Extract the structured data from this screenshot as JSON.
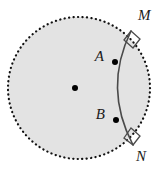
{
  "figure": {
    "type": "geometry-diagram",
    "width": 166,
    "height": 170,
    "background_color": "#ffffff"
  },
  "colors": {
    "disk_fill": "#e3e3e3",
    "disk_border": "#111111",
    "arc_stroke": "#4a4a4a",
    "point_fill": "#000000",
    "label_color": "#1a1a1a",
    "right_angle_stroke": "#4a4a4a"
  },
  "circle": {
    "name": "main-circle",
    "center_x": 79,
    "center_y": 88,
    "radius": 71,
    "border_style": "dotted",
    "border_width": 2.2,
    "fill": "#e3e3e3"
  },
  "arc": {
    "name": "circular-arc-MN",
    "start_x": 131,
    "start_y": 31,
    "end_x": 133,
    "end_y": 145,
    "control_x": 103,
    "control_y": 88,
    "stroke_width": 1.6,
    "bulge_direction": "left"
  },
  "points": [
    {
      "id": "center",
      "label": "",
      "x": 75,
      "y": 88,
      "r": 3.0,
      "has_label": false
    },
    {
      "id": "A",
      "label": "A",
      "x": 115,
      "y": 62,
      "r": 3.0,
      "has_label": true,
      "label_x": 104,
      "label_y": 61,
      "anchor": "end"
    },
    {
      "id": "B",
      "label": "B",
      "x": 116,
      "y": 120,
      "r": 3.0,
      "has_label": true,
      "label_x": 105,
      "label_y": 119,
      "anchor": "end"
    },
    {
      "id": "M",
      "label": "M",
      "x": 131,
      "y": 31,
      "r": 0,
      "has_label": true,
      "label_x": 138,
      "label_y": 20,
      "anchor": "start"
    },
    {
      "id": "N",
      "label": "N",
      "x": 133,
      "y": 145,
      "r": 0,
      "has_label": true,
      "label_x": 136,
      "label_y": 161,
      "anchor": "start"
    }
  ],
  "right_angle_marks": [
    {
      "id": "right-angle-at-M",
      "at_point": "M",
      "polygon": "131,31 140,39 133,48 124,40",
      "size": 11
    },
    {
      "id": "right-angle-at-N",
      "at_point": "N",
      "polygon": "133,145 124,138 131,128 140,136",
      "size": 11
    }
  ],
  "labels": {
    "point_a": "A",
    "point_b": "B",
    "point_m": "M",
    "point_n": "N"
  }
}
